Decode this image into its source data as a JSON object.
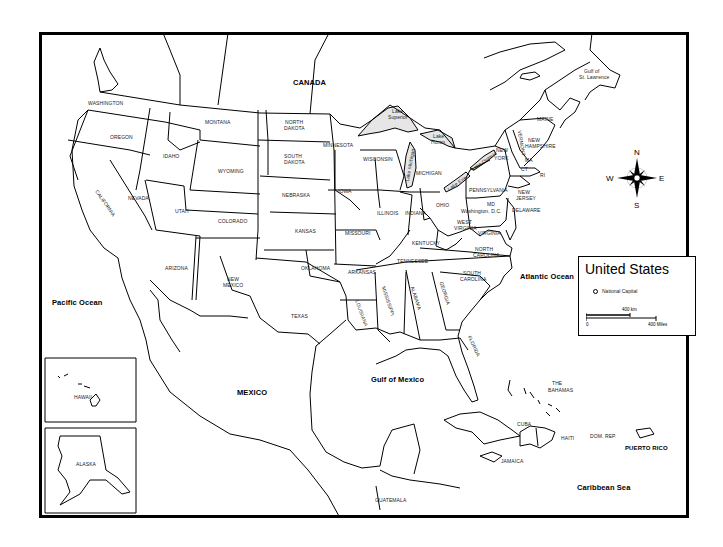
{
  "map": {
    "title": "United States",
    "legend": {
      "title": "United States",
      "capital_marker": "National Capital",
      "scale_km": "400 km",
      "scale_zero": "0",
      "scale_miles": "400 Miles"
    },
    "compass": {
      "n": "N",
      "s": "S",
      "e": "E",
      "w": "W"
    },
    "countries": {
      "canada": "CANADA",
      "mexico": "MEXICO",
      "puerto_rico": "PUERTO RICO",
      "cuba": "CUBA",
      "haiti": "HAITI",
      "dom_rep": "DOM. REP.",
      "jamaica": "JAMAICA",
      "bahamas_1": "THE",
      "bahamas_2": "BAHAMAS",
      "guatemala": "GUATEMALA"
    },
    "water": {
      "pacific": "Pacific Ocean",
      "atlantic": "Atlantic Ocean",
      "gulf_mexico": "Gulf of Mexico",
      "caribbean": "Caribbean Sea",
      "gulf_st_lawrence_1": "Gulf of",
      "gulf_st_lawrence_2": "St. Lawrence",
      "lake_superior_1": "Lake",
      "lake_superior_2": "Superior",
      "lake_huron_1": "Lake",
      "lake_huron_2": "Huron",
      "lake_michigan": "Lake Michigan",
      "lake_erie": "Lake Erie",
      "lake_ontario": "Lake Ontario"
    },
    "states": {
      "washington": "WASHINGTON",
      "oregon": "OREGON",
      "california": "CALIFORNIA",
      "idaho": "IDAHO",
      "nevada": "NEVADA",
      "montana": "MONTANA",
      "wyoming": "WYOMING",
      "utah": "UTAH",
      "arizona": "ARIZONA",
      "colorado": "COLORADO",
      "new_mexico_1": "NEW",
      "new_mexico_2": "MEXICO",
      "north_dakota_1": "NORTH",
      "north_dakota_2": "DAKOTA",
      "south_dakota_1": "SOUTH",
      "south_dakota_2": "DAKOTA",
      "nebraska": "NEBRASKA",
      "kansas": "KANSAS",
      "oklahoma": "OKLAHOMA",
      "texas": "TEXAS",
      "minnesota": "MINNESOTA",
      "iowa": "IOWA",
      "missouri": "MISSOURI",
      "arkansas": "ARKANSAS",
      "louisiana": "LOUISIANA",
      "wisconsin": "WISCONSIN",
      "illinois": "ILLINOIS",
      "michigan": "MICHIGAN",
      "indiana": "INDIANA",
      "ohio": "OHIO",
      "kentucky": "KENTUCKY",
      "tennessee": "TENNESSEE",
      "mississippi": "MISSISSIPPI",
      "alabama": "ALABAMA",
      "georgia": "GEORGIA",
      "florida": "FLORIDA",
      "south_carolina_1": "SOUTH",
      "south_carolina_2": "CAROLINA",
      "north_carolina_1": "NORTH",
      "north_carolina_2": "CAROLINA",
      "virginia": "VIRGINIA",
      "west_virginia_1": "WEST",
      "west_virginia_2": "VIRGINIA",
      "pennsylvania": "PENNSYLVANIA",
      "new_york_1": "NEW",
      "new_york_2": "YORK",
      "vermont": "VERMONT",
      "new_hampshire_1": "NEW",
      "new_hampshire_2": "HAMPSHIRE",
      "maine": "MAINE",
      "massachusetts": "MA",
      "connecticut": "CT",
      "rhode_island": "RI",
      "new_jersey_1": "NEW",
      "new_jersey_2": "JERSEY",
      "delaware": "DELAWARE",
      "maryland": "MD",
      "dc": "Washington, D.C.",
      "hawaii": "HAWAII",
      "alaska": "ALASKA"
    }
  }
}
